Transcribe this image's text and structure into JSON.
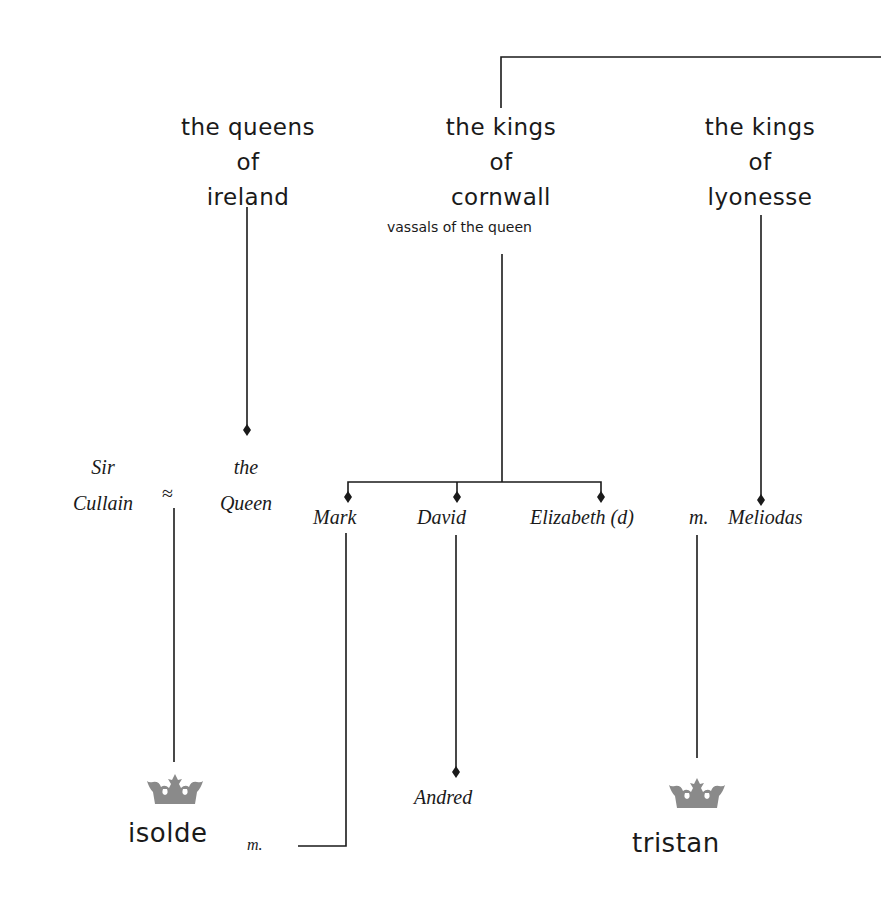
{
  "houses": [
    {
      "id": "ireland",
      "lines": [
        "the queens",
        "of",
        "ireland"
      ]
    },
    {
      "id": "cornwall",
      "lines": [
        "the kings",
        "of",
        "cornwall"
      ],
      "note": "vassals of the queen"
    },
    {
      "id": "lyonesse",
      "lines": [
        "the kings",
        "of",
        "lyonesse"
      ]
    }
  ],
  "people": {
    "sir_cullain": {
      "lines": [
        "Sir",
        "Cullain"
      ]
    },
    "queen": {
      "lines": [
        "the",
        "Queen"
      ]
    },
    "cullain_queen_relation": "≈",
    "mark": "Mark",
    "david": "David",
    "elizabeth": "Elizabeth (d)",
    "elizabeth_meliodas_relation": "m.",
    "meliodas": "Meliodas",
    "andred": "Andred",
    "isolde": "isolde",
    "isolde_mark_relation": "m.",
    "tristan": "tristan"
  },
  "icons": {
    "isolde_crown": "crown-icon",
    "tristan_crown": "crown-icon"
  },
  "colors": {
    "ink": "#1a1a1a",
    "crown": "#8a8a8a",
    "background": "#ffffff"
  }
}
